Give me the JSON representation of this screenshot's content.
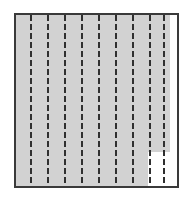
{
  "figure": {
    "canvas": {
      "width": 193,
      "height": 204,
      "background_color": "#ffffff"
    },
    "panel": {
      "name": "outer-rectangle",
      "x": 15,
      "y": 14,
      "width": 163,
      "height": 173,
      "border_color": "#3a3a3a",
      "border_width": 1.5,
      "fill_color": "#ffffff"
    },
    "shaded_region": {
      "name": "gray-shaded-area",
      "fill_color": "#d2d2d2",
      "x": 16,
      "y": 15,
      "width": 154,
      "height": 171,
      "notch": {
        "name": "white-notch-bottom-right",
        "fill_color": "#ffffff",
        "x": 148,
        "y": 152,
        "width": 22,
        "height": 34
      },
      "right_margin_strip": {
        "name": "white-right-strip",
        "fill_color": "#ffffff",
        "x": 170,
        "y": 15,
        "width": 7,
        "height": 171
      }
    },
    "dashed_lines": {
      "name": "vertical-dashed-lines",
      "count": 9,
      "color": "#2f2f2f",
      "stroke_width": 2,
      "dash_length": 6,
      "gap_length": 3,
      "y_start": 15,
      "y_end": 186,
      "x_positions": [
        31,
        48,
        65,
        82,
        99,
        116,
        133,
        150,
        164
      ]
    }
  },
  "chart_data": {
    "type": "bar",
    "title": "",
    "xlabel": "",
    "ylabel": "",
    "categories": [
      "1",
      "2",
      "3",
      "4",
      "5",
      "6",
      "7",
      "8",
      "9"
    ],
    "values": [
      171,
      171,
      171,
      171,
      171,
      171,
      171,
      171,
      171
    ],
    "grid": false,
    "legend": null,
    "annotations": [
      "9 evenly spaced vertical dashed rules spanning full panel height",
      "Uniform light gray fill behind the rules",
      "White rectangular notch cut from the lower-right of the gray fill",
      "Narrow white margin strip along the right inner edge of the panel"
    ]
  }
}
